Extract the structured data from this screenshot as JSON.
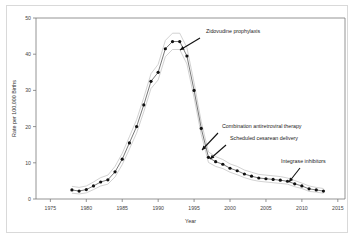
{
  "chart_data": {
    "type": "line",
    "title": "",
    "xlabel": "Year",
    "ylabel": "Rate per 100,000 Births",
    "xlim": [
      1973,
      2016
    ],
    "ylim": [
      0,
      50
    ],
    "grid": false,
    "legend": "none",
    "xticks": [
      1975,
      1980,
      1985,
      1990,
      1995,
      2000,
      2005,
      2010,
      2015
    ],
    "yticks": [
      0,
      10,
      20,
      30,
      40,
      50
    ],
    "x": [
      1978,
      1979,
      1980,
      1981,
      1982,
      1983,
      1984,
      1985,
      1986,
      1987,
      1988,
      1989,
      1990,
      1991,
      1992,
      1993,
      1994,
      1995,
      1996,
      1997,
      1998,
      1999,
      2000,
      2001,
      2002,
      2003,
      2004,
      2005,
      2006,
      2007,
      2008,
      2009,
      2010,
      2011,
      2012,
      2013
    ],
    "series": [
      {
        "name": "Rate",
        "values": [
          2.5,
          2.2,
          2.6,
          3.6,
          4.7,
          5.3,
          7.5,
          11.0,
          15.5,
          20.0,
          26.0,
          32.5,
          35.0,
          41.5,
          43.5,
          43.5,
          39.5,
          30.0,
          19.5,
          11.5,
          10.3,
          9.6,
          8.5,
          7.8,
          6.9,
          6.3,
          5.8,
          5.6,
          5.4,
          5.2,
          4.9,
          4.2,
          3.6,
          2.8,
          2.5,
          2.2
        ]
      },
      {
        "name": "Upper bound",
        "values": [
          3.5,
          3.2,
          3.6,
          4.7,
          5.9,
          6.6,
          9.0,
          12.6,
          17.2,
          21.9,
          28.0,
          34.6,
          37.2,
          43.8,
          45.8,
          45.8,
          41.8,
          32.1,
          21.3,
          13.0,
          11.7,
          10.9,
          9.7,
          9.0,
          8.0,
          7.4,
          6.8,
          6.6,
          6.4,
          6.2,
          5.8,
          5.1,
          4.4,
          3.6,
          3.2,
          2.9
        ]
      },
      {
        "name": "Lower bound",
        "values": [
          1.6,
          1.4,
          1.7,
          2.6,
          3.6,
          4.1,
          6.1,
          9.5,
          13.8,
          18.2,
          24.1,
          30.5,
          32.9,
          39.3,
          41.3,
          41.3,
          37.3,
          28.0,
          17.8,
          10.1,
          9.0,
          8.4,
          7.4,
          6.7,
          5.9,
          5.3,
          4.9,
          4.7,
          4.5,
          4.3,
          4.1,
          3.4,
          2.9,
          2.1,
          1.9,
          1.6
        ]
      }
    ],
    "annotations": [
      {
        "id": "zidovudine-prophylaxis",
        "label": "Zidovudine prophylaxis",
        "text_x": 206,
        "text_y": 33,
        "arrow_from_x": 200,
        "arrow_from_y": 38,
        "arrow_to_x": 180,
        "arrow_to_y": 50
      },
      {
        "id": "combination-antiretroviral-therapy",
        "label": "Combination antiretroviral therapy",
        "text_x": 222,
        "text_y": 128,
        "arrow_from_x": 218,
        "arrow_from_y": 133,
        "arrow_to_x": 202,
        "arrow_to_y": 150
      },
      {
        "id": "scheduled-cesarean-delivery",
        "label": "Scheduled cesarean delivery",
        "text_x": 230,
        "text_y": 140,
        "arrow_from_x": 226,
        "arrow_from_y": 145,
        "arrow_to_x": 210,
        "arrow_to_y": 159
      },
      {
        "id": "integrase-inhibitors",
        "label": "Integrase inhibitors",
        "text_x": 281,
        "text_y": 163,
        "arrow_from_x": 300,
        "arrow_from_y": 168,
        "arrow_to_x": 289,
        "arrow_to_y": 182
      }
    ],
    "colors": {
      "line": "#555555",
      "band": "#bfbfbf",
      "point": "#111111",
      "axis": "#7a7a7a",
      "text": "#222222",
      "frame": "#d9d9d9"
    }
  }
}
